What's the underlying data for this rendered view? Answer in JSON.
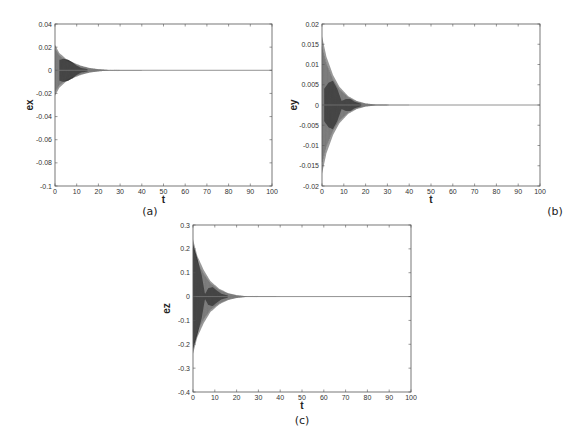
{
  "chart_data": [
    {
      "type": "line",
      "panel": "(a)",
      "title": "",
      "xlabel": "t",
      "ylabel": "ex",
      "xlim": [
        0,
        100
      ],
      "ylim": [
        -0.1,
        0.04
      ],
      "xticks": [
        0,
        10,
        20,
        30,
        40,
        50,
        60,
        70,
        80,
        90,
        100
      ],
      "yticks": [
        -0.1,
        -0.08,
        -0.06,
        -0.04,
        -0.02,
        0,
        0.02,
        0.04
      ],
      "ytick_labels": [
        "-0.1",
        "-0.08",
        "-0.06",
        "-0.04",
        "-0.02",
        "0",
        "0.02",
        "0.04"
      ],
      "grid": false,
      "description": "Damped oscillation of error ex converging to 0 by t≈25",
      "envelope": {
        "x": [
          0,
          2,
          5,
          8,
          12,
          16,
          20,
          25,
          100
        ],
        "amplitude": [
          0.022,
          0.015,
          0.01,
          0.007,
          0.004,
          0.002,
          0.001,
          0.0002,
          0
        ]
      },
      "dark_band": {
        "x": [
          2,
          4,
          6,
          8,
          10,
          12,
          15
        ],
        "amplitude": [
          0.009,
          0.01,
          0.009,
          0.007,
          0.004,
          0.002,
          0.001
        ]
      }
    },
    {
      "type": "line",
      "panel": "(b)",
      "title": "",
      "xlabel": "t",
      "ylabel": "ey",
      "xlim": [
        0,
        100
      ],
      "ylim": [
        -0.02,
        0.02
      ],
      "xticks": [
        0,
        10,
        20,
        30,
        40,
        50,
        60,
        70,
        80,
        90,
        100
      ],
      "yticks": [
        -0.02,
        -0.015,
        -0.01,
        -0.005,
        0,
        0.005,
        0.01,
        0.015,
        0.02
      ],
      "ytick_labels": [
        "-0.02",
        "-0.015",
        "-0.01",
        "-0.005",
        "0",
        "0.005",
        "0.01",
        "0.015",
        "0.02"
      ],
      "grid": false,
      "description": "Damped oscillation of error ey converging to 0 by t≈25",
      "envelope": {
        "x": [
          0,
          2,
          5,
          8,
          12,
          16,
          20,
          25,
          100
        ],
        "amplitude": [
          0.017,
          0.012,
          0.0075,
          0.0045,
          0.0022,
          0.001,
          0.0004,
          0.0001,
          0
        ]
      },
      "dark_band": {
        "x": [
          1,
          3,
          5,
          7,
          9,
          11,
          13,
          15,
          18
        ],
        "amplitude": [
          0.004,
          0.0055,
          0.006,
          0.004,
          0.001,
          0.0015,
          0.0015,
          0.0008,
          0.0003
        ]
      }
    },
    {
      "type": "line",
      "panel": "(c)",
      "title": "",
      "xlabel": "t",
      "ylabel": "ez",
      "xlim": [
        0,
        100
      ],
      "ylim": [
        -0.4,
        0.3
      ],
      "xticks": [
        0,
        10,
        20,
        30,
        40,
        50,
        60,
        70,
        80,
        90,
        100
      ],
      "yticks": [
        -0.4,
        -0.3,
        -0.2,
        -0.1,
        0,
        0.1,
        0.2,
        0.3
      ],
      "ytick_labels": [
        "-0.4",
        "-0.3",
        "-0.2",
        "-0.1",
        "0",
        "0.1",
        "0.2",
        "0.3"
      ],
      "grid": false,
      "description": "Damped oscillation of error ez converging to 0 by t≈28",
      "envelope": {
        "x": [
          0,
          2,
          5,
          8,
          12,
          16,
          20,
          25,
          100
        ],
        "amplitude": [
          0.24,
          0.17,
          0.11,
          0.065,
          0.033,
          0.015,
          0.006,
          0.001,
          0
        ]
      },
      "dark_band": {
        "x": [
          0,
          2,
          4,
          5.5,
          7,
          9,
          11,
          13,
          16
        ],
        "amplitude": [
          0.22,
          0.16,
          0.09,
          0.01,
          0.035,
          0.04,
          0.025,
          0.012,
          0.004
        ]
      }
    }
  ],
  "panels": {
    "a": {
      "caption": "(a)",
      "xlabel": "t",
      "ylabel": "ex"
    },
    "b": {
      "caption": "(b)",
      "xlabel": "t",
      "ylabel": "ey"
    },
    "c": {
      "caption": "(c)",
      "xlabel": "t",
      "ylabel": "ez"
    }
  },
  "colors": {
    "axis": "#555555",
    "envelope": "#9a9a9a",
    "dark_band": "#3a3a3a",
    "baseline": "#777777"
  }
}
